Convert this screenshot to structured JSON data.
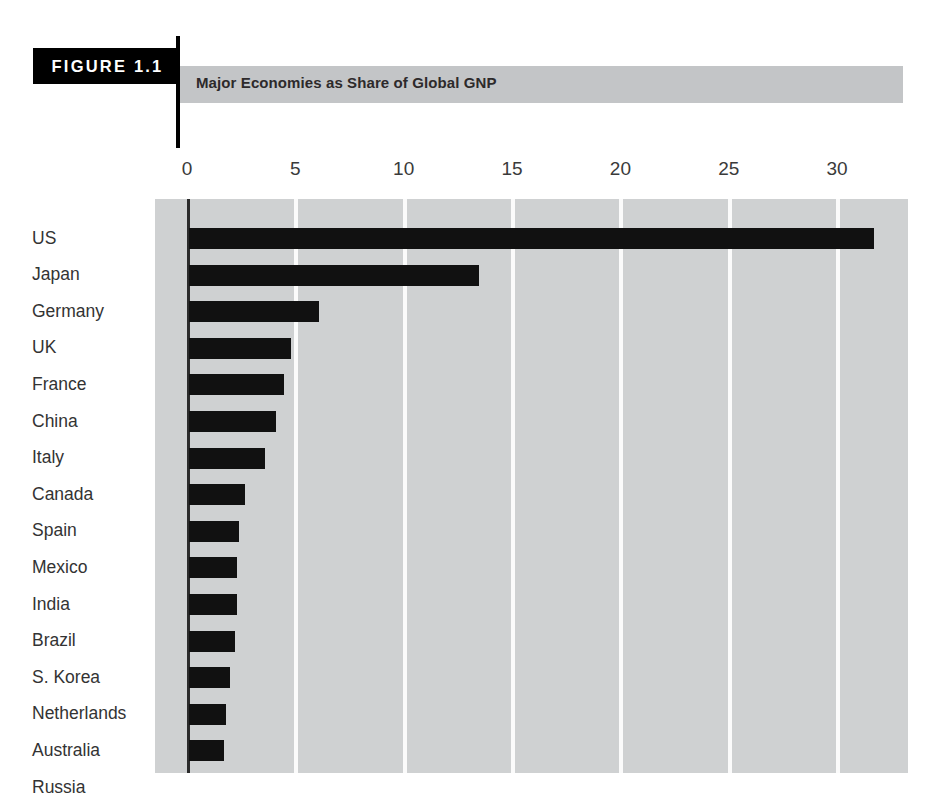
{
  "figure": {
    "badge_label": "FIGURE 1.1",
    "title": "Major Economies as Share of Global GNP"
  },
  "chart_data": {
    "type": "bar",
    "orientation": "horizontal",
    "title": "Major Economies as Share of Global GNP",
    "xlabel": "",
    "ylabel": "",
    "xlim": [
      0,
      34.7
    ],
    "xticks": [
      0,
      5,
      10,
      15,
      20,
      25,
      30
    ],
    "xtick_labels": [
      "0",
      "5",
      "10",
      "15",
      "20",
      "25",
      "30"
    ],
    "grid": true,
    "legend": "none",
    "plot_background": "#cfd1d2",
    "gridline_color": "#fbfbfb",
    "bar_color": "#111111",
    "categories": [
      "US",
      "Japan",
      "Germany",
      "UK",
      "France",
      "China",
      "Italy",
      "Canada",
      "Spain",
      "Mexico",
      "India",
      "Brazil",
      "S. Korea",
      "Netherlands",
      "Australia",
      "Russia"
    ],
    "values": [
      31.6,
      13.4,
      6.0,
      4.7,
      4.4,
      4.0,
      3.5,
      2.6,
      2.3,
      2.2,
      2.2,
      2.1,
      1.9,
      1.7,
      1.6,
      1.3
    ]
  }
}
